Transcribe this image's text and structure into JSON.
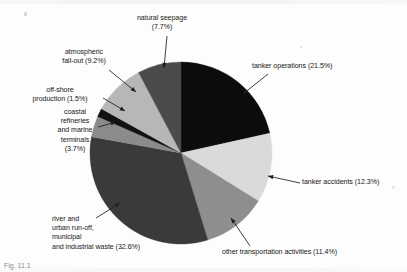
{
  "figure": {
    "caption_partial": "Fig. 11.1",
    "background_color": "#fdfdfd",
    "text_color": "#191919"
  },
  "chart_data": {
    "type": "pie",
    "title": "",
    "subtitle": "",
    "xlabel": "",
    "ylabel": "",
    "grid": false,
    "legend_position": "callout-labels",
    "units": "percent",
    "start_angle_deg": 0,
    "direction": "clockwise",
    "total_percent": 99.9,
    "center": {
      "x": 181,
      "y": 153
    },
    "radius": 91,
    "categories": [
      "tanker operations",
      "tanker accidents",
      "other transportation activities",
      "river and urban run-off, municipal and industrial waste",
      "coastal refineries and marine terminals",
      "off-shore production",
      "atmospheric fall-out",
      "natural seepage"
    ],
    "values": [
      21.5,
      12.3,
      11.4,
      32.6,
      3.7,
      1.5,
      9.2,
      7.7
    ],
    "colors": [
      "#0c0c0c",
      "#dadada",
      "#8e8e8e",
      "#3a3a3a",
      "#8b8b8b",
      "#121212",
      "#b7b7b7",
      "#4b4b4b"
    ],
    "slices": [
      {
        "label": "tanker operations",
        "value": 21.5,
        "display": "tanker operations (21.5%)",
        "color": "#0c0c0c"
      },
      {
        "label": "tanker accidents",
        "value": 12.3,
        "display": "tanker accidents (12.3%)",
        "color": "#dadada"
      },
      {
        "label": "other transportation activities",
        "value": 11.4,
        "display": "other transportation activities (11.4%)",
        "color": "#8e8e8e"
      },
      {
        "label": "river and urban run-off, municipal and industrial waste",
        "value": 32.6,
        "display": "and industrial waste (32.6%)",
        "color": "#3a3a3a"
      },
      {
        "label": "coastal refineries and marine terminals",
        "value": 3.7,
        "display": "coastal refineries and marine terminals (3.7%)",
        "color": "#8b8b8b"
      },
      {
        "label": "off-shore production",
        "value": 1.5,
        "display": "off-shore production (1.5%)",
        "color": "#121212"
      },
      {
        "label": "atmospheric fall-out",
        "value": 9.2,
        "display": "atmospheric fall-out (9.2%)",
        "color": "#b7b7b7"
      },
      {
        "label": "natural seepage",
        "value": 7.7,
        "display": "natural seepage (7.7%)",
        "color": "#4b4b4b"
      }
    ]
  },
  "callouts": {
    "natural_seepage": {
      "text": "natural seepage\n(7.7%)"
    },
    "atmospheric_fallout": {
      "text": "atmospheric\nfall-out (9.2%)"
    },
    "offshore_production": {
      "text": "off-shore\nproduction (1.5%)"
    },
    "coastal_refineries": {
      "text": "coastal\nrefineries\nand marine\nterminals\n(3.7%)"
    },
    "river_runoff": {
      "text": "river and\nurban run-off,\nmunicipal\nand industrial waste (32.6%)"
    },
    "tanker_operations": {
      "text": "tanker operations (21.5%)"
    },
    "tanker_accidents": {
      "text": "tanker accidents (12.3%)"
    },
    "other_transportation": {
      "text": "other transportation activities (11.4%)"
    }
  }
}
